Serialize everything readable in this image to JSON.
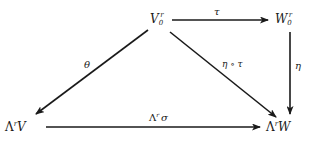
{
  "diagram": {
    "type": "commutative-diagram",
    "nodes": [
      {
        "id": "V0r",
        "base": "V",
        "sub": "0",
        "sup": "r",
        "x": 164,
        "y": 20
      },
      {
        "id": "W0r",
        "base": "W",
        "sub": "0",
        "sup": "r",
        "x": 282,
        "y": 20
      },
      {
        "id": "LrV",
        "prefix": "Λ",
        "sup": "r",
        "base": "V",
        "x": 18,
        "y": 128
      },
      {
        "id": "LrW",
        "prefix": "Λ",
        "sup": "r",
        "base": "W",
        "x": 283,
        "y": 128
      }
    ],
    "edges": [
      {
        "from": "V0r",
        "to": "W0r",
        "label": "τ"
      },
      {
        "from": "V0r",
        "to": "LrV",
        "label": "θ"
      },
      {
        "from": "V0r",
        "to": "LrW",
        "label": "η ∘ τ"
      },
      {
        "from": "W0r",
        "to": "LrW",
        "label": "η"
      },
      {
        "from": "LrV",
        "to": "LrW",
        "label": "Λʳ σ"
      }
    ]
  },
  "labels": {
    "V0r_base": "V",
    "V0r_sub": "0",
    "V0r_sup": "r",
    "W0r_base": "W",
    "W0r_sub": "0",
    "W0r_sup": "r",
    "LrV_prefix": "Λ",
    "LrV_sup": "r",
    "LrV_base": "V",
    "LrW_prefix": "Λ",
    "LrW_sup": "r",
    "LrW_base": "W",
    "tau": "τ",
    "theta": "θ",
    "eta_tau": "η ∘ τ",
    "eta": "η",
    "lambda_sigma_prefix": "Λ",
    "lambda_sigma_sup": "r",
    "lambda_sigma_sigma": "σ"
  }
}
